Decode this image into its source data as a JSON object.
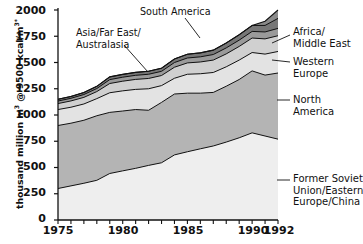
{
  "chart_data": {
    "type": "area",
    "stacked": true,
    "title": "",
    "subtitle": "",
    "xlabel": "",
    "ylabel": "thousand million m3 @ 9500 kcal/m3*",
    "ylabel_parts": {
      "prefix": "thousand million m",
      "sup1": "3",
      "middle": " @ 9500 kcal/m",
      "sup2": "3*"
    },
    "xlim": [
      1975,
      1992
    ],
    "ylim": [
      0,
      2000
    ],
    "grid": false,
    "legend_position": "callouts",
    "yticks": [
      0,
      250,
      500,
      750,
      1000,
      1250,
      1500,
      1750,
      2000
    ],
    "ytick_labels": [
      "0",
      "250",
      "500",
      "750",
      "1000",
      "1250",
      "1500",
      "1750",
      "2000"
    ],
    "xticks": [
      1975,
      1980,
      1985,
      1990,
      1992
    ],
    "xtick_labels": [
      "1975",
      "1980",
      "1985",
      "1990",
      "1992"
    ],
    "x": [
      1975,
      1976,
      1977,
      1978,
      1979,
      1980,
      1981,
      1982,
      1983,
      1984,
      1985,
      1986,
      1987,
      1988,
      1989,
      1990,
      1991,
      1992
    ],
    "series": [
      {
        "name": "Former Soviet Union/Eastern Europe/China",
        "color": "#eeeeee",
        "values": [
          300,
          325,
          350,
          378,
          443,
          468,
          492,
          520,
          545,
          620,
          650,
          678,
          705,
          742,
          783,
          830,
          800,
          770
        ],
        "cumulative": [
          300,
          325,
          350,
          378,
          443,
          468,
          492,
          520,
          545,
          620,
          650,
          678,
          705,
          742,
          783,
          830,
          800,
          770
        ]
      },
      {
        "name": "North America",
        "color": "#b4b4b4",
        "values": [
          600,
          597,
          600,
          615,
          582,
          570,
          560,
          525,
          575,
          580,
          558,
          530,
          510,
          532,
          555,
          590,
          580,
          630
        ],
        "cumulative": [
          900,
          922,
          950,
          993,
          1025,
          1038,
          1052,
          1045,
          1120,
          1200,
          1208,
          1208,
          1215,
          1274,
          1338,
          1420,
          1380,
          1400
        ]
      },
      {
        "name": "Western Europe",
        "color": "#e3e3e3",
        "values": [
          152,
          152,
          155,
          163,
          187,
          192,
          192,
          205,
          160,
          150,
          180,
          185,
          190,
          185,
          185,
          175,
          200,
          205
        ],
        "cumulative": [
          1052,
          1074,
          1105,
          1156,
          1212,
          1230,
          1244,
          1250,
          1280,
          1350,
          1388,
          1393,
          1405,
          1459,
          1523,
          1595,
          1580,
          1605
        ]
      },
      {
        "name": "Asia/Far East/Australasia",
        "color": "#d0d0d0",
        "values": [
          57,
          60,
          63,
          67,
          88,
          92,
          95,
          98,
          96,
          105,
          108,
          112,
          118,
          123,
          130,
          138,
          145,
          150
        ],
        "cumulative": [
          1109,
          1134,
          1168,
          1223,
          1300,
          1322,
          1339,
          1348,
          1376,
          1455,
          1496,
          1505,
          1523,
          1582,
          1653,
          1733,
          1725,
          1755
        ]
      },
      {
        "name": "South America",
        "color": "#9a9a9a",
        "values": [
          24,
          25,
          27,
          29,
          37,
          38,
          39,
          40,
          40,
          45,
          47,
          49,
          53,
          57,
          60,
          63,
          66,
          70
        ],
        "cumulative": [
          1133,
          1159,
          1195,
          1252,
          1337,
          1360,
          1378,
          1388,
          1416,
          1500,
          1543,
          1554,
          1576,
          1639,
          1713,
          1796,
          1791,
          1825
        ]
      },
      {
        "name": "Africa/Middle East",
        "color": "#777777",
        "values": [
          17,
          18,
          19,
          21,
          26,
          27,
          28,
          29,
          30,
          34,
          36,
          38,
          42,
          47,
          52,
          57,
          62,
          95
        ],
        "cumulative": [
          1150,
          1177,
          1214,
          1273,
          1363,
          1387,
          1406,
          1417,
          1446,
          1534,
          1579,
          1592,
          1618,
          1686,
          1765,
          1853,
          1853,
          1920
        ]
      },
      {
        "name": "top-band",
        "color": "#8a8a8a",
        "values": [
          0,
          0,
          0,
          0,
          0,
          0,
          0,
          0,
          0,
          0,
          0,
          0,
          0,
          0,
          0,
          0,
          40,
          80
        ],
        "cumulative": [
          1150,
          1177,
          1214,
          1273,
          1363,
          1387,
          1406,
          1417,
          1446,
          1534,
          1579,
          1592,
          1618,
          1686,
          1765,
          1853,
          1893,
          2000
        ]
      }
    ],
    "callouts": [
      {
        "id": "south-america",
        "text": "South America"
      },
      {
        "id": "asia-far-east",
        "line1": "Asia/Far East/",
        "line2": "Australasia"
      },
      {
        "id": "africa-middle-east",
        "line1": "Africa/",
        "line2": "Middle East"
      },
      {
        "id": "western-europe",
        "line1": "Western",
        "line2": "Europe"
      },
      {
        "id": "north-america",
        "line1": "North",
        "line2": "America"
      },
      {
        "id": "former-soviet",
        "line1": "Former Soviet",
        "line2": "Union/Eastern",
        "line3": "Europe/China"
      }
    ]
  }
}
